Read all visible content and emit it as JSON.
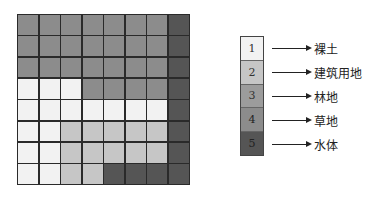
{
  "classes": [
    {
      "id": 1,
      "label": "1",
      "name": "裸土",
      "color": "#f2f2f2"
    },
    {
      "id": 2,
      "label": "2",
      "name": "建筑用地",
      "color": "#c6c6c6"
    },
    {
      "id": 3,
      "label": "3",
      "name": "林地",
      "color": "#9c9c9c"
    },
    {
      "id": 4,
      "label": "4",
      "name": "草地",
      "color": "#8c8c8c"
    },
    {
      "id": 5,
      "label": "5",
      "name": "水体",
      "color": "#555555"
    }
  ],
  "grid": {
    "rows": 8,
    "cols": 8,
    "cells": [
      [
        4,
        4,
        4,
        4,
        4,
        4,
        4,
        5
      ],
      [
        4,
        4,
        4,
        4,
        4,
        4,
        4,
        5
      ],
      [
        4,
        4,
        4,
        4,
        4,
        4,
        4,
        5
      ],
      [
        1,
        1,
        1,
        4,
        4,
        4,
        4,
        5
      ],
      [
        1,
        1,
        1,
        1,
        1,
        1,
        1,
        5
      ],
      [
        1,
        1,
        2,
        2,
        2,
        2,
        2,
        5
      ],
      [
        1,
        1,
        2,
        2,
        2,
        2,
        2,
        5
      ],
      [
        1,
        1,
        2,
        2,
        5,
        5,
        5,
        5
      ]
    ]
  },
  "legend": {
    "items": [
      {
        "number": "1",
        "label": "裸土"
      },
      {
        "number": "2",
        "label": "建筑用地"
      },
      {
        "number": "3",
        "label": "林地"
      },
      {
        "number": "4",
        "label": "草地"
      },
      {
        "number": "5",
        "label": "水体"
      }
    ]
  }
}
